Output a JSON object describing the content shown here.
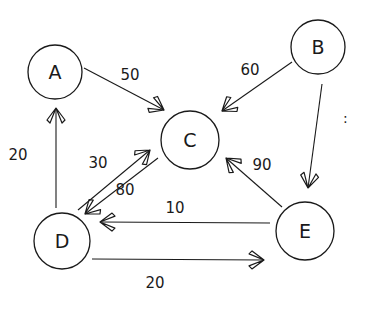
{
  "diagram": {
    "type": "directed-weighted-graph",
    "style": "hand-drawn",
    "colors": {
      "ink": "#1a1a1a",
      "background": "#ffffff"
    },
    "nodes": [
      {
        "id": "A",
        "label": "A",
        "cx": 55,
        "cy": 72,
        "r": 27
      },
      {
        "id": "B",
        "label": "B",
        "cx": 318,
        "cy": 47,
        "r": 27
      },
      {
        "id": "C",
        "label": "C",
        "cx": 190,
        "cy": 140,
        "r": 29
      },
      {
        "id": "D",
        "label": "D",
        "cx": 62,
        "cy": 241,
        "r": 28
      },
      {
        "id": "E",
        "label": "E",
        "cx": 305,
        "cy": 231,
        "r": 29
      }
    ],
    "edges": [
      {
        "from": "A",
        "to": "C",
        "weight": "50",
        "x1": 84,
        "y1": 68,
        "x2": 164,
        "y2": 110,
        "lx": 130,
        "ly": 80
      },
      {
        "from": "B",
        "to": "C",
        "weight": "60",
        "x1": 292,
        "y1": 62,
        "x2": 222,
        "y2": 111,
        "lx": 250,
        "ly": 75
      },
      {
        "from": "B",
        "to": "E",
        "weight": "",
        "x1": 322,
        "y1": 84,
        "x2": 308,
        "y2": 188,
        "lx": 0,
        "ly": 0
      },
      {
        "from": "D",
        "to": "A",
        "weight": "20",
        "x1": 56,
        "y1": 208,
        "x2": 56,
        "y2": 108,
        "lx": 18,
        "ly": 160
      },
      {
        "from": "D",
        "to": "C",
        "weight": "30",
        "x1": 78,
        "y1": 210,
        "x2": 150,
        "y2": 150,
        "lx": 98,
        "ly": 168
      },
      {
        "from": "C",
        "to": "D",
        "weight": "80",
        "x1": 158,
        "y1": 158,
        "x2": 85,
        "y2: ": 0,
        "y2": 214,
        "lx": 125,
        "ly": 195
      },
      {
        "from": "E",
        "to": "D",
        "weight": "10",
        "x1": 270,
        "y1": 223,
        "x2": 100,
        "y2": 222,
        "lx": 175,
        "ly": 213
      },
      {
        "from": "D",
        "to": "E",
        "weight": "20",
        "x1": 92,
        "y1": 259,
        "x2": 264,
        "y2": 260,
        "lx": 155,
        "ly": 288
      },
      {
        "from": "E",
        "to": "C",
        "weight": "90",
        "x1": 282,
        "y1": 207,
        "x2": 226,
        "y2": 158,
        "lx": 262,
        "ly": 170
      }
    ],
    "annotations": [
      {
        "text": ":",
        "x": 343,
        "y": 123
      }
    ]
  }
}
